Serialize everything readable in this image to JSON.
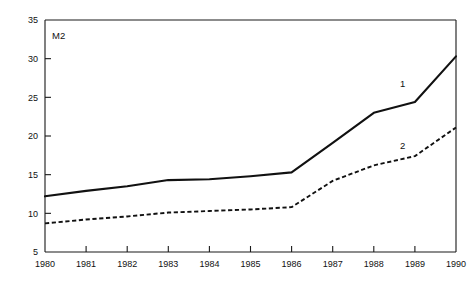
{
  "chart_data": {
    "type": "line",
    "title": "",
    "ylabel": "M2",
    "xlabel": "",
    "x": [
      1980,
      1981,
      1982,
      1983,
      1984,
      1985,
      1986,
      1987,
      1988,
      1989,
      1990
    ],
    "categories": [
      "1980",
      "1981",
      "1982",
      "1983",
      "1984",
      "1985",
      "1986",
      "1987",
      "1988",
      "1989",
      "1990"
    ],
    "xlim": [
      1980,
      1990
    ],
    "ylim": [
      5,
      35
    ],
    "yticks": [
      5,
      10,
      15,
      20,
      25,
      30,
      35
    ],
    "ytick_labels": [
      "5",
      "10",
      "15",
      "20",
      "25",
      "30",
      "35"
    ],
    "xtick_labels": [
      "1980",
      "1981",
      "1982",
      "1983",
      "1984",
      "1985",
      "1986",
      "1987",
      "1988",
      "1989",
      "1990"
    ],
    "grid": false,
    "legend_position": "inline-end-of-line",
    "series": [
      {
        "name": "1",
        "label": "1",
        "style": "solid",
        "color": "#111111",
        "values": [
          12.2,
          12.9,
          13.5,
          14.3,
          14.4,
          14.8,
          15.3,
          19.1,
          23.0,
          24.4,
          30.3
        ]
      },
      {
        "name": "2",
        "label": "2",
        "style": "dashed",
        "color": "#111111",
        "values": [
          8.7,
          9.2,
          9.6,
          10.1,
          10.3,
          10.5,
          10.8,
          14.2,
          16.2,
          17.4,
          21.1
        ]
      }
    ],
    "annotations": [
      {
        "text": "1",
        "series": "1",
        "x": 1988.7,
        "y": 26.3
      },
      {
        "text": "2",
        "series": "2",
        "x": 1988.7,
        "y": 18.3
      }
    ]
  }
}
